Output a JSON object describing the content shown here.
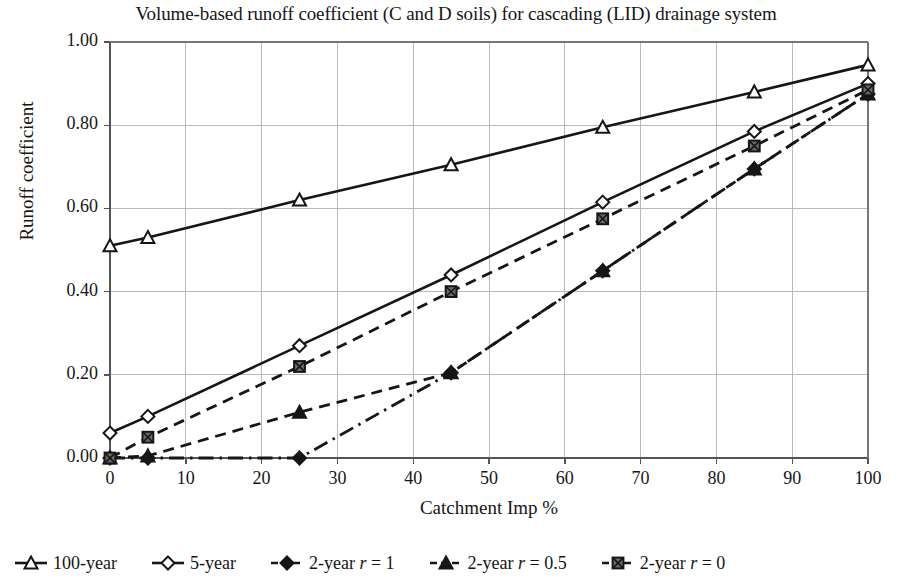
{
  "chart_data": {
    "type": "line",
    "title": "Volume-based runoff coefficient (C and D soils) for cascading (LID) drainage system",
    "xlabel": "Catchment Imp %",
    "ylabel": "Runoff coefficient",
    "xlim": [
      0,
      100
    ],
    "ylim": [
      0,
      1.0
    ],
    "xticks": [
      "0",
      "10",
      "20",
      "30",
      "40",
      "50",
      "60",
      "70",
      "80",
      "90",
      "100"
    ],
    "xtick_values": [
      0,
      10,
      20,
      30,
      40,
      50,
      60,
      70,
      80,
      90,
      100
    ],
    "yticks": [
      "0.00",
      "0.20",
      "0.40",
      "0.60",
      "0.80",
      "1.00"
    ],
    "ytick_values": [
      0.0,
      0.2,
      0.4,
      0.6,
      0.8,
      1.0
    ],
    "grid": true,
    "grid_color": "#b9b9b9",
    "legend_position": "bottom",
    "line_color": "#161616",
    "series": [
      {
        "name": "100-year",
        "marker": "triangle-open",
        "linestyle": "solid",
        "x": [
          0,
          5,
          25,
          45,
          65,
          85,
          100
        ],
        "values": [
          0.51,
          0.53,
          0.62,
          0.705,
          0.795,
          0.88,
          0.945
        ]
      },
      {
        "name": "5-year",
        "marker": "diamond-open",
        "linestyle": "solid",
        "x": [
          0,
          5,
          25,
          45,
          65,
          85,
          100
        ],
        "values": [
          0.06,
          0.1,
          0.27,
          0.44,
          0.615,
          0.785,
          0.9
        ]
      },
      {
        "name": "2-year r = 1",
        "marker": "diamond-filled",
        "linestyle": "dashdot",
        "x": [
          0,
          5,
          25,
          45,
          65,
          85,
          100
        ],
        "values": [
          0.0,
          0.0,
          0.0,
          0.205,
          0.45,
          0.695,
          0.875
        ]
      },
      {
        "name": "2-year r = 0.5",
        "marker": "triangle-filled",
        "linestyle": "dashed",
        "x": [
          0,
          5,
          25,
          45,
          65,
          85,
          100
        ],
        "values": [
          0.0,
          0.005,
          0.11,
          0.205,
          0.45,
          0.695,
          0.875
        ]
      },
      {
        "name": "2-year r = 0",
        "marker": "square-filled",
        "linestyle": "dashed",
        "x": [
          0,
          5,
          25,
          45,
          65,
          85,
          100
        ],
        "values": [
          0.0,
          0.05,
          0.22,
          0.4,
          0.575,
          0.75,
          0.885
        ]
      }
    ]
  },
  "legend": {
    "entries": [
      {
        "label_pre": "100-year",
        "label_italic": "",
        "label_post": ""
      },
      {
        "label_pre": "5-year",
        "label_italic": "",
        "label_post": ""
      },
      {
        "label_pre": "2-year ",
        "label_italic": "r",
        "label_post": " = 1"
      },
      {
        "label_pre": "2-year ",
        "label_italic": "r",
        "label_post": " = 0.5"
      },
      {
        "label_pre": "2-year ",
        "label_italic": "r",
        "label_post": " = 0"
      }
    ]
  }
}
